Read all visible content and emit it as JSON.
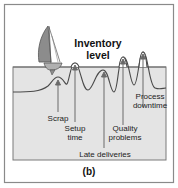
{
  "figure": {
    "caption": "(b)",
    "title_line1": "Inventory",
    "title_line2": "level",
    "colors": {
      "frame": "#8a8a8a",
      "water": "#e4e4e4",
      "water_edge": "#7a7a7a",
      "rock_line": "#555555",
      "sail": "#8c8c8c",
      "arrow": "#6a6a6a"
    },
    "rocks": [
      {
        "label_lines": [
          "Scrap"
        ]
      },
      {
        "label_lines": [
          "Setup",
          "time"
        ]
      },
      {
        "label_lines": [
          "Late deliveries"
        ]
      },
      {
        "label_lines": [
          "Quality",
          "problems"
        ]
      },
      {
        "label_lines": [
          "Process",
          "downtime"
        ]
      }
    ]
  }
}
